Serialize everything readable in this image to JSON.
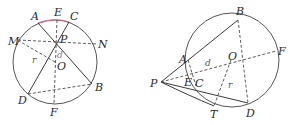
{
  "colors": {
    "line": "#3a3a3a",
    "circle": "#555555",
    "arc_highlight": "#d9708a",
    "label_d_left": "#9a6aa0",
    "background": "#ffffff"
  },
  "figures": [
    {
      "name": "chord-intersection-figure",
      "circle": {
        "cx": 55,
        "cy": 62,
        "r": 42
      },
      "labels": {
        "A": "A",
        "E": "E",
        "C": "C",
        "M": "M",
        "P": "P",
        "N": "N",
        "r": "r",
        "d": "d",
        "O": "O",
        "D": "D",
        "B": "B",
        "F": "F"
      }
    },
    {
      "name": "secant-tangent-figure",
      "circle": {
        "cx": 232,
        "cy": 60,
        "r": 47
      },
      "labels": {
        "B": "B",
        "F": "F",
        "A": "A",
        "O": "O",
        "d": "d",
        "P": "P",
        "E": "E",
        "C": "C",
        "r": "r",
        "T": "T",
        "D": "D"
      }
    }
  ]
}
